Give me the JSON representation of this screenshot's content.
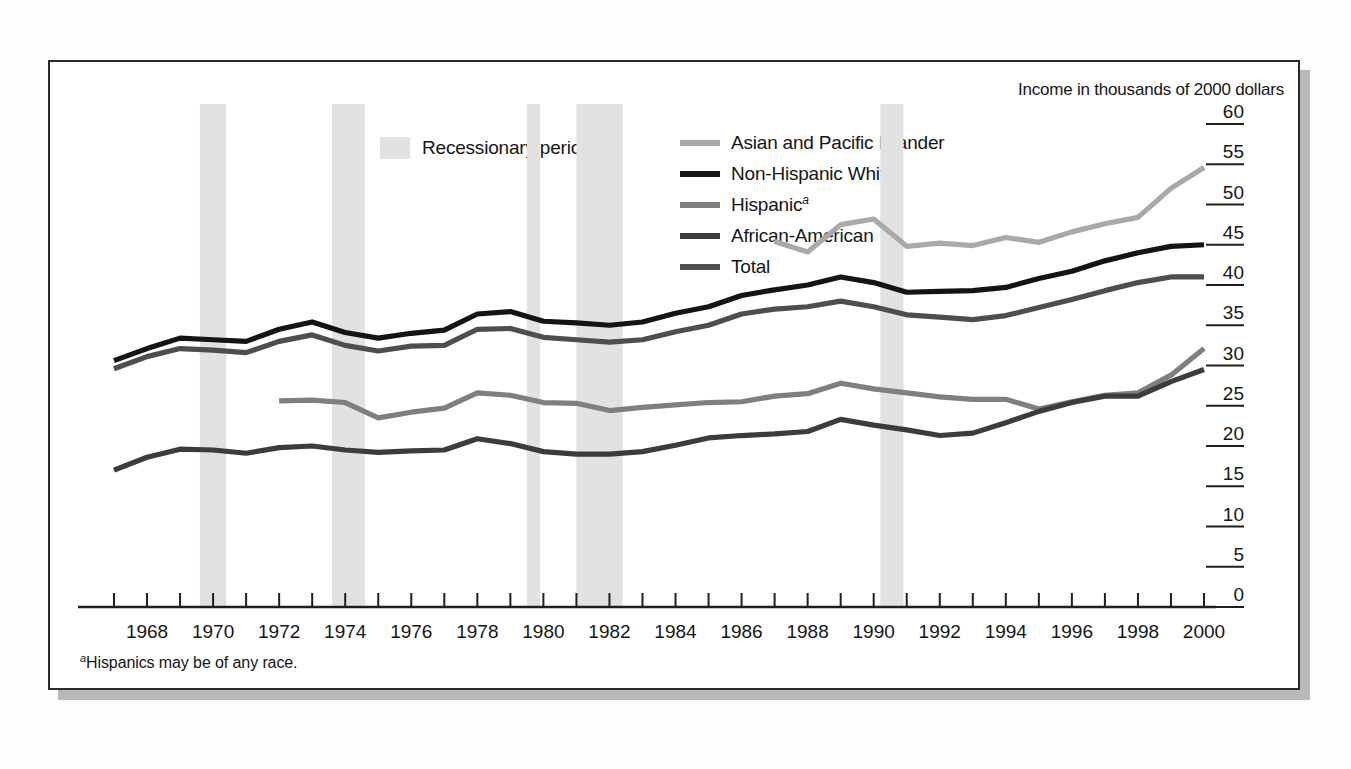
{
  "figure": {
    "units_note": "Income in thousands of 2000 dollars",
    "footnote_marker": "a",
    "footnote": "Hispanics may be of any race.",
    "recession_legend_label": "Recessionary periods",
    "recession_swatch_color": "#e2e2e2"
  },
  "legend": {
    "items": [
      {
        "label": "Asian and Pacific Islander",
        "color": "#a9a9a9",
        "marker": ""
      },
      {
        "label": "Non-Hispanic White",
        "color": "#141414",
        "marker": ""
      },
      {
        "label": "Hispanic",
        "color": "#7f7f7f",
        "marker": "a"
      },
      {
        "label": "African-American",
        "color": "#3c3c3c",
        "marker": ""
      },
      {
        "label": "Total",
        "color": "#4e4e4e",
        "marker": ""
      }
    ]
  },
  "chart_data": {
    "type": "line",
    "title": "",
    "subtitle": "",
    "xlabel": "",
    "ylabel": "Income in thousands of 2000 dollars",
    "xlim": [
      1967,
      2000
    ],
    "ylim": [
      0,
      60
    ],
    "yticks": [
      0,
      5,
      10,
      15,
      20,
      25,
      30,
      35,
      40,
      45,
      50,
      55,
      60
    ],
    "ytick_labels": [
      "0",
      "5",
      "10",
      "15",
      "20",
      "25",
      "30",
      "35",
      "40",
      "45",
      "50",
      "55",
      "60"
    ],
    "xticks": [
      1967,
      1968,
      1969,
      1970,
      1971,
      1972,
      1973,
      1974,
      1975,
      1976,
      1977,
      1978,
      1979,
      1980,
      1981,
      1982,
      1983,
      1984,
      1985,
      1986,
      1987,
      1988,
      1989,
      1990,
      1991,
      1992,
      1993,
      1994,
      1995,
      1996,
      1997,
      1998,
      1999,
      2000
    ],
    "xtick_labels_shown": [
      "1968",
      "1970",
      "1972",
      "1974",
      "1976",
      "1978",
      "1980",
      "1982",
      "1984",
      "1986",
      "1988",
      "1990",
      "1992",
      "1994",
      "1996",
      "1998",
      "2000"
    ],
    "grid": false,
    "legend_position": "top",
    "y_axis_side": "right",
    "series": [
      {
        "name": "Asian and Pacific Islander",
        "color": "#a9a9a9",
        "x": [
          1987,
          1988,
          1989,
          1990,
          1991,
          1992,
          1993,
          1994,
          1995,
          1996,
          1997,
          1998,
          1999,
          2000
        ],
        "values": [
          45.4,
          44.1,
          47.5,
          48.2,
          44.8,
          45.2,
          44.9,
          45.9,
          45.3,
          46.6,
          47.6,
          48.4,
          52.0,
          54.6
        ]
      },
      {
        "name": "Non-Hispanic White",
        "color": "#141414",
        "x": [
          1967,
          1968,
          1969,
          1970,
          1971,
          1972,
          1973,
          1974,
          1975,
          1976,
          1977,
          1978,
          1979,
          1980,
          1981,
          1982,
          1983,
          1984,
          1985,
          1986,
          1987,
          1988,
          1989,
          1990,
          1991,
          1992,
          1993,
          1994,
          1995,
          1996,
          1997,
          1998,
          1999,
          2000
        ],
        "values": [
          30.6,
          32.1,
          33.4,
          33.2,
          33.0,
          34.5,
          35.4,
          34.1,
          33.4,
          34.0,
          34.4,
          36.4,
          36.7,
          35.5,
          35.3,
          35.0,
          35.4,
          36.5,
          37.3,
          38.7,
          39.4,
          40.0,
          41.0,
          40.3,
          39.1,
          39.2,
          39.3,
          39.7,
          40.8,
          41.7,
          43.0,
          44.0,
          44.8,
          45.0
        ]
      },
      {
        "name": "Hispanic",
        "color": "#7f7f7f",
        "x": [
          1972,
          1973,
          1974,
          1975,
          1976,
          1977,
          1978,
          1979,
          1980,
          1981,
          1982,
          1983,
          1984,
          1985,
          1986,
          1987,
          1988,
          1989,
          1990,
          1991,
          1992,
          1993,
          1994,
          1995,
          1996,
          1997,
          1998,
          1999,
          2000
        ],
        "values": [
          25.6,
          25.7,
          25.4,
          23.5,
          24.2,
          24.7,
          26.6,
          26.3,
          25.4,
          25.3,
          24.4,
          24.8,
          25.1,
          25.4,
          25.5,
          26.2,
          26.5,
          27.8,
          27.1,
          26.6,
          26.1,
          25.8,
          25.8,
          24.6,
          25.5,
          26.3,
          26.6,
          28.8,
          32.1
        ]
      },
      {
        "name": "African-American",
        "color": "#3c3c3c",
        "x": [
          1967,
          1968,
          1969,
          1970,
          1971,
          1972,
          1973,
          1974,
          1975,
          1976,
          1977,
          1978,
          1979,
          1980,
          1981,
          1982,
          1983,
          1984,
          1985,
          1986,
          1987,
          1988,
          1989,
          1990,
          1991,
          1992,
          1993,
          1994,
          1995,
          1996,
          1997,
          1998,
          1999,
          2000
        ],
        "values": [
          17.0,
          18.6,
          19.6,
          19.5,
          19.1,
          19.8,
          20.0,
          19.5,
          19.2,
          19.4,
          19.5,
          20.9,
          20.3,
          19.3,
          19.0,
          19.0,
          19.3,
          20.1,
          21.0,
          21.3,
          21.5,
          21.8,
          23.3,
          22.6,
          22.0,
          21.3,
          21.6,
          22.9,
          24.3,
          25.4,
          26.2,
          26.2,
          28.0,
          29.5
        ]
      },
      {
        "name": "Total",
        "color": "#4e4e4e",
        "x": [
          1967,
          1968,
          1969,
          1970,
          1971,
          1972,
          1973,
          1974,
          1975,
          1976,
          1977,
          1978,
          1979,
          1980,
          1981,
          1982,
          1983,
          1984,
          1985,
          1986,
          1987,
          1988,
          1989,
          1990,
          1991,
          1992,
          1993,
          1994,
          1995,
          1996,
          1997,
          1998,
          1999,
          2000
        ],
        "values": [
          29.6,
          31.1,
          32.1,
          31.9,
          31.6,
          33.0,
          33.8,
          32.5,
          31.8,
          32.4,
          32.5,
          34.5,
          34.6,
          33.5,
          33.2,
          32.9,
          33.2,
          34.2,
          35.0,
          36.4,
          37.0,
          37.3,
          38.0,
          37.3,
          36.3,
          36.0,
          35.7,
          36.2,
          37.2,
          38.2,
          39.3,
          40.3,
          41.0,
          41.0
        ]
      }
    ],
    "recession_bands": [
      {
        "start": 1969.6,
        "end": 1970.4
      },
      {
        "start": 1973.6,
        "end": 1974.6
      },
      {
        "start": 1979.5,
        "end": 1979.9
      },
      {
        "start": 1981.0,
        "end": 1982.4
      },
      {
        "start": 1990.2,
        "end": 1990.9
      }
    ]
  }
}
